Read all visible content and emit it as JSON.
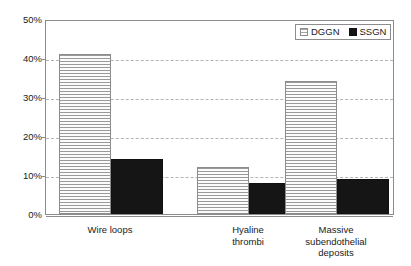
{
  "chart_data": {
    "type": "bar",
    "title": "",
    "subtitle": "",
    "xlabel": "",
    "ylabel": "",
    "categories": [
      "Wire loops",
      "Hyaline thrombi",
      "Massive subendothelial deposits"
    ],
    "category_lines": [
      [
        "Wire loops"
      ],
      [
        "Hyaline",
        "thrombi"
      ],
      [
        "Massive",
        "subendothelial",
        "deposits"
      ]
    ],
    "series": [
      {
        "name": "DGGN",
        "values": [
          41,
          12,
          34
        ],
        "color": "#f2f2f2",
        "pattern": "horizontal-lines"
      },
      {
        "name": "SSGN",
        "values": [
          14,
          8,
          9
        ],
        "color": "#151515",
        "pattern": "solid"
      }
    ],
    "ylim": [
      0,
      50
    ],
    "yticks": [
      0,
      10,
      20,
      30,
      40,
      50
    ],
    "ytick_labels": [
      "0%",
      "10%",
      "20%",
      "30%",
      "40%",
      "50%"
    ],
    "grid": true,
    "grid_axis": "y",
    "legend_position": "top-right"
  },
  "legend": {
    "entries": [
      {
        "label": "DGGN"
      },
      {
        "label": "SSGN"
      }
    ]
  }
}
